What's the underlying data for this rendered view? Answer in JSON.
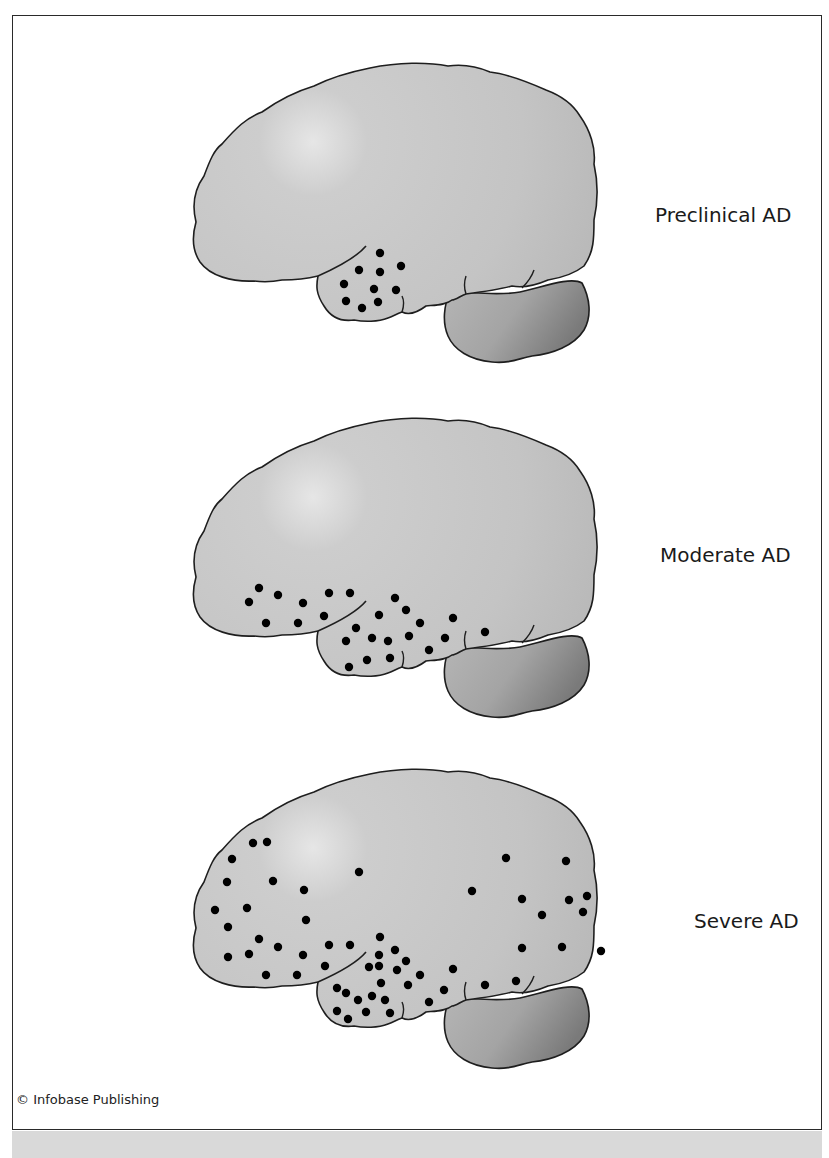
{
  "figure": {
    "credit": "© Infobase Publishing",
    "colors": {
      "cerebrum_fill": "#c6c6c6",
      "cerebrum_highlight": "#e4e4e4",
      "cerebellum_light": "#b4b4b4",
      "cerebellum_dark": "#7e7e7e",
      "outline": "#1e1e1e",
      "plaque_dot": "#000000",
      "band": "#d9d9d9"
    },
    "stages": [
      {
        "label": "Preclinical AD",
        "offset_y": 0,
        "dots": [
          [
            380,
            253
          ],
          [
            359,
            270
          ],
          [
            380,
            272
          ],
          [
            401,
            266
          ],
          [
            344,
            284
          ],
          [
            374,
            289
          ],
          [
            396,
            290
          ],
          [
            346,
            301
          ],
          [
            362,
            308
          ],
          [
            378,
            302
          ]
        ]
      },
      {
        "label": "Moderate AD",
        "offset_y": 355,
        "dots": [
          [
            259,
            588
          ],
          [
            249,
            602
          ],
          [
            278,
            595
          ],
          [
            303,
            603
          ],
          [
            329,
            593
          ],
          [
            350,
            593
          ],
          [
            266,
            623
          ],
          [
            298,
            623
          ],
          [
            324,
            616
          ],
          [
            356,
            628
          ],
          [
            395,
            598
          ],
          [
            406,
            610
          ],
          [
            379,
            615
          ],
          [
            420,
            623
          ],
          [
            453,
            618
          ],
          [
            485,
            632
          ],
          [
            346,
            641
          ],
          [
            372,
            638
          ],
          [
            388,
            641
          ],
          [
            409,
            636
          ],
          [
            445,
            638
          ],
          [
            349,
            667
          ],
          [
            367,
            660
          ],
          [
            390,
            658
          ],
          [
            429,
            650
          ]
        ]
      },
      {
        "label": "Severe AD",
        "offset_y": 706,
        "dots": [
          [
            253,
            843
          ],
          [
            267,
            842
          ],
          [
            232,
            859
          ],
          [
            227,
            882
          ],
          [
            273,
            881
          ],
          [
            304,
            890
          ],
          [
            359,
            872
          ],
          [
            215,
            910
          ],
          [
            247,
            908
          ],
          [
            228,
            927
          ],
          [
            306,
            920
          ],
          [
            259,
            939
          ],
          [
            278,
            947
          ],
          [
            228,
            957
          ],
          [
            249,
            954
          ],
          [
            303,
            955
          ],
          [
            266,
            975
          ],
          [
            297,
            975
          ],
          [
            329,
            945
          ],
          [
            350,
            945
          ],
          [
            325,
            966
          ],
          [
            380,
            937
          ],
          [
            379,
            955
          ],
          [
            395,
            950
          ],
          [
            369,
            967
          ],
          [
            379,
            966
          ],
          [
            406,
            961
          ],
          [
            397,
            970
          ],
          [
            420,
            975
          ],
          [
            337,
            988
          ],
          [
            346,
            993
          ],
          [
            358,
            1000
          ],
          [
            372,
            996
          ],
          [
            385,
            1000
          ],
          [
            381,
            983
          ],
          [
            408,
            985
          ],
          [
            337,
            1011
          ],
          [
            348,
            1019
          ],
          [
            366,
            1012
          ],
          [
            390,
            1013
          ],
          [
            429,
            1002
          ],
          [
            444,
            990
          ],
          [
            453,
            969
          ],
          [
            485,
            985
          ],
          [
            516,
            981
          ],
          [
            506,
            858
          ],
          [
            566,
            861
          ],
          [
            472,
            891
          ],
          [
            522,
            899
          ],
          [
            569,
            900
          ],
          [
            587,
            896
          ],
          [
            583,
            912
          ],
          [
            542,
            915
          ],
          [
            522,
            948
          ],
          [
            562,
            947
          ],
          [
            601,
            951
          ]
        ]
      }
    ]
  }
}
